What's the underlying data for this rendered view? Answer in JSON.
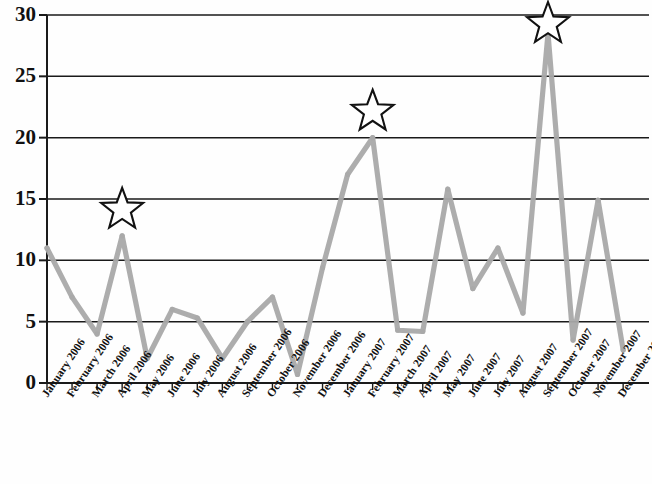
{
  "chart_data": {
    "type": "line",
    "title": "",
    "subtitle": "",
    "xlabel": "",
    "ylabel": "",
    "ylim": [
      0,
      30
    ],
    "ytick_values": [
      0,
      5,
      10,
      15,
      20,
      25,
      30
    ],
    "ytick_labels": [
      "0",
      "5",
      "10",
      "15",
      "20",
      "25",
      "30"
    ],
    "grid": true,
    "grid_axis": "y",
    "legend": false,
    "legend_position": "none",
    "line_color": "#a9a9a9",
    "axis_color": "#1a1a1a",
    "marker_color": "#a9a9a9",
    "categories": [
      "January 2006",
      "February 2006",
      "March 2006",
      "April 2006",
      "May 2006",
      "June 2006",
      "July 2006",
      "August 2006",
      "September 2006",
      "October 2006",
      "November 2006",
      "December 2006",
      "January 2007",
      "February 2007",
      "March 2007",
      "April 2007",
      "May 2007",
      "June 2007",
      "July 2007",
      "August 2007",
      "September 2007",
      "October 2007",
      "November 2007",
      "December 2007"
    ],
    "values": [
      11.0,
      7.0,
      4.0,
      12.0,
      2.0,
      6.0,
      5.3,
      2.0,
      5.0,
      7.0,
      0.7,
      9.4,
      17.0,
      20.0,
      4.3,
      4.2,
      15.8,
      7.7,
      11.0,
      5.7,
      28.5,
      3.5,
      14.9,
      2.7
    ],
    "annotations": [
      {
        "kind": "star",
        "category": "April 2006",
        "value": 12.0,
        "label": "star-marker"
      },
      {
        "kind": "star",
        "category": "February 2007",
        "value": 20.0,
        "label": "star-marker"
      },
      {
        "kind": "star",
        "category": "September 2007",
        "value": 28.5,
        "label": "star-marker"
      }
    ]
  }
}
